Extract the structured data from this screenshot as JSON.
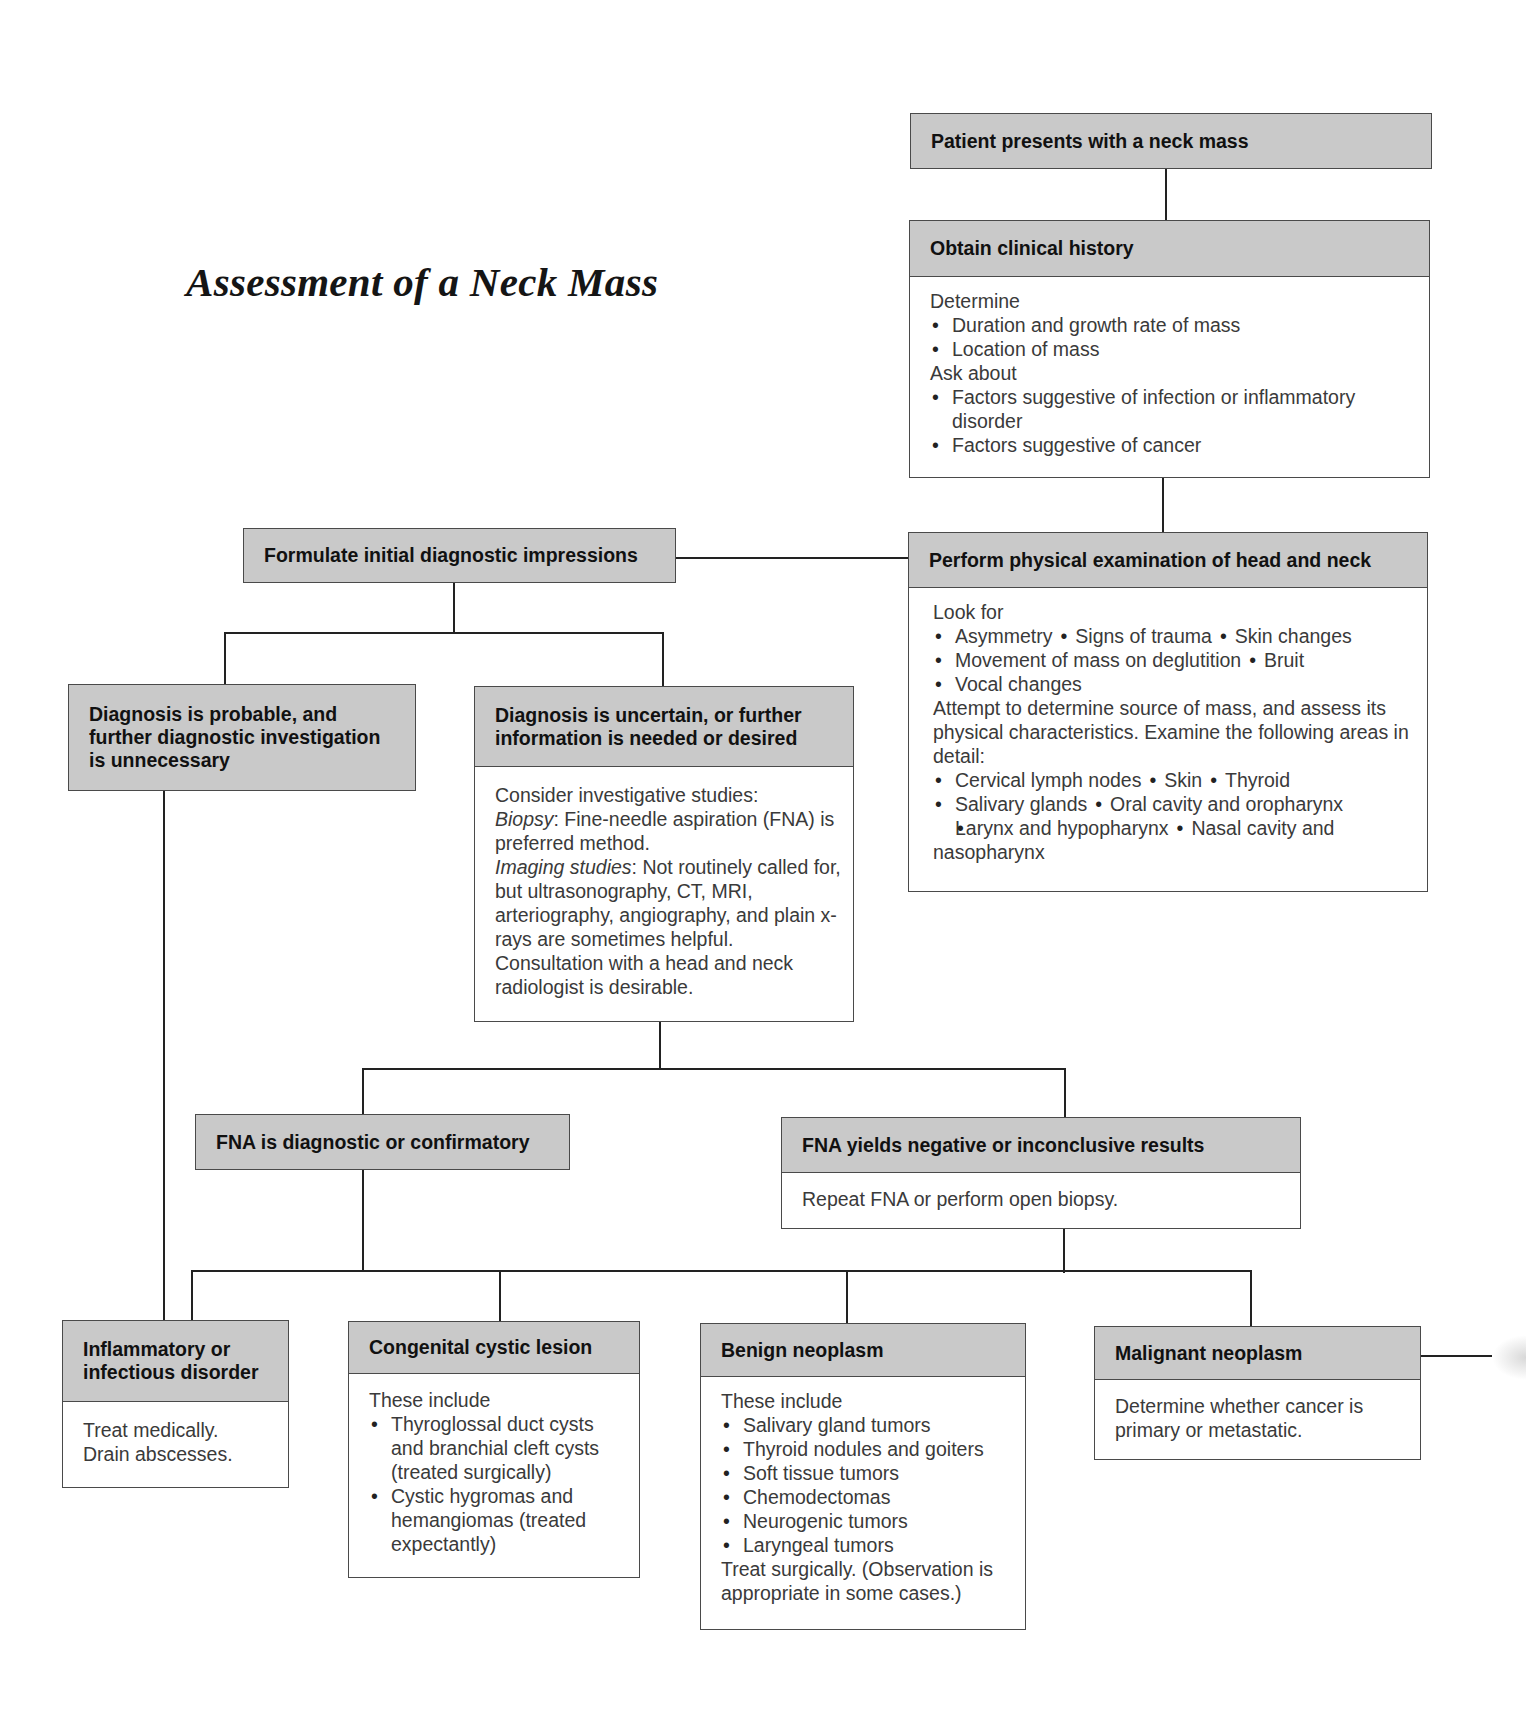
{
  "title": "Assessment of a Neck Mass",
  "nodes": {
    "patient": {
      "header": "Patient presents with a neck mass"
    },
    "history": {
      "header": "Obtain clinical history",
      "sections": [
        {
          "label": "Determine",
          "items": [
            "Duration and growth rate of mass",
            "Location of mass"
          ]
        },
        {
          "label": "Ask about",
          "items": [
            "Factors suggestive of infection or inflammatory disorder",
            "Factors suggestive of cancer"
          ]
        }
      ]
    },
    "exam": {
      "header": "Perform physical examination of head and neck",
      "look_for_label": "Look for",
      "look_for_rows": [
        [
          "Asymmetry",
          "Signs of trauma",
          "Skin changes"
        ],
        [
          "Movement of mass on deglutition",
          "Bruit"
        ],
        [
          "Vocal changes"
        ]
      ],
      "attempt_text": "Attempt to determine source of mass, and assess its physical characteristics. Examine the following areas in detail:",
      "areas_rows": [
        [
          "Cervical lymph nodes",
          "Skin",
          "Thyroid"
        ],
        [
          "Salivary glands",
          "Oral cavity and oropharynx"
        ],
        [
          "Larynx and hypopharynx",
          "Nasal cavity and nasopharynx"
        ]
      ]
    },
    "formulate": {
      "header": "Formulate initial diagnostic impressions"
    },
    "probable": {
      "header": "Diagnosis is probable, and further diagnostic investigation is unnecessary"
    },
    "uncertain": {
      "header": "Diagnosis is uncertain, or further information is needed or desired",
      "intro": "Consider investigative studies:",
      "biopsy_label": "Biopsy",
      "biopsy_text": ": Fine-needle aspiration (FNA) is preferred method.",
      "imaging_label": "Imaging studies",
      "imaging_text": ": Not routinely called for, but ultrasonography, CT, MRI, arteriography, angiography, and plain x-rays are sometimes helpful.",
      "consult_text": "Consultation with a head and neck radiologist is desirable."
    },
    "fna_diagnostic": {
      "header": "FNA is diagnostic or confirmatory"
    },
    "fna_negative": {
      "header": "FNA yields negative or inconclusive results",
      "body": "Repeat FNA or perform open biopsy."
    },
    "inflammatory": {
      "header": "Inflammatory or infectious disorder",
      "lines": [
        "Treat medically.",
        "Drain abscesses."
      ]
    },
    "congenital": {
      "header": "Congenital cystic lesion",
      "intro": "These include",
      "items": [
        "Thyroglossal duct cysts and branchial cleft cysts (treated surgically)",
        "Cystic hygromas and hemangiomas (treated expectantly)"
      ]
    },
    "benign": {
      "header": "Benign neoplasm",
      "intro": "These include",
      "items": [
        "Salivary gland tumors",
        "Thyroid nodules and goiters",
        "Soft tissue tumors",
        "Chemodectomas",
        "Neurogenic tumors",
        "Laryngeal tumors"
      ],
      "outro": "Treat surgically. (Observation is appropriate in some cases.)"
    },
    "malignant": {
      "header": "Malignant neoplasm",
      "body": "Determine whether cancer is primary or metastatic."
    }
  },
  "colors": {
    "header_fill": "#c9c9c9",
    "border": "#4a4a4a",
    "line": "#222222",
    "body_text": "#3a3a3a"
  }
}
